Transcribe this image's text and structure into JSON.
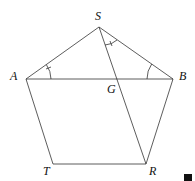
{
  "diagram": {
    "points": {
      "S": {
        "label": "S",
        "x": 99,
        "y": 27
      },
      "A": {
        "label": "A",
        "x": 26,
        "y": 79
      },
      "B": {
        "label": "B",
        "x": 173,
        "y": 79
      },
      "G": {
        "label": "G",
        "x": 113,
        "y": 79
      },
      "T": {
        "label": "T",
        "x": 53,
        "y": 164
      },
      "R": {
        "label": "R",
        "x": 146,
        "y": 164
      }
    },
    "segments": [
      "SA",
      "SB",
      "AB",
      "AT",
      "TR",
      "RB",
      "SR"
    ],
    "angle_marks": [
      {
        "at": "A",
        "between": "SA-AB",
        "ticks": 1
      },
      {
        "at": "S",
        "between": "SR-SB",
        "ticks": 1
      },
      {
        "at": "B",
        "between": "AB-BS",
        "ticks": 0
      }
    ],
    "line_color": "#333333"
  }
}
